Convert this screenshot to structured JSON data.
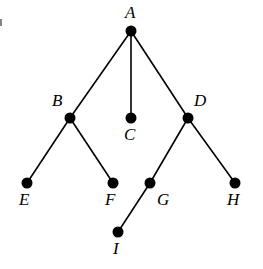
{
  "figure": {
    "width": 263,
    "height": 269,
    "background_color": "#ffffff",
    "stroke_color": "#000000",
    "node_fill_color": "#000000",
    "node_radius": 5.5,
    "edge_width": 1.6
  },
  "chart_data": {
    "type": "diagram",
    "subtype": "undirected-graph-tree",
    "title": "",
    "xlabel": "",
    "ylabel": "",
    "grid": false,
    "legend": null,
    "nodes": [
      {
        "id": "A",
        "label": "A",
        "x": 131,
        "y": 31,
        "label_x": 125,
        "label_y": 4,
        "label_position": "above"
      },
      {
        "id": "B",
        "label": "B",
        "x": 70,
        "y": 118,
        "label_x": 52,
        "label_y": 92,
        "label_position": "upper-left"
      },
      {
        "id": "C",
        "label": "C",
        "x": 131,
        "y": 118,
        "label_x": 124,
        "label_y": 126,
        "label_position": "below"
      },
      {
        "id": "D",
        "label": "D",
        "x": 188,
        "y": 118,
        "label_x": 194,
        "label_y": 92,
        "label_position": "upper-right"
      },
      {
        "id": "E",
        "label": "E",
        "x": 27,
        "y": 183,
        "label_x": 19,
        "label_y": 191,
        "label_position": "below"
      },
      {
        "id": "F",
        "label": "F",
        "x": 113,
        "y": 183,
        "label_x": 105,
        "label_y": 191,
        "label_position": "below"
      },
      {
        "id": "G",
        "label": "G",
        "x": 150,
        "y": 183,
        "label_x": 157,
        "label_y": 191,
        "label_position": "lower-right"
      },
      {
        "id": "H",
        "label": "H",
        "x": 235,
        "y": 183,
        "label_x": 227,
        "label_y": 191,
        "label_position": "below"
      },
      {
        "id": "I",
        "label": "I",
        "x": 118,
        "y": 232,
        "label_x": 113,
        "label_y": 240,
        "label_position": "below"
      }
    ],
    "edges": [
      {
        "from": "A",
        "to": "B"
      },
      {
        "from": "A",
        "to": "C"
      },
      {
        "from": "A",
        "to": "D"
      },
      {
        "from": "B",
        "to": "E"
      },
      {
        "from": "B",
        "to": "F"
      },
      {
        "from": "D",
        "to": "G"
      },
      {
        "from": "D",
        "to": "H"
      },
      {
        "from": "G",
        "to": "I"
      }
    ]
  }
}
